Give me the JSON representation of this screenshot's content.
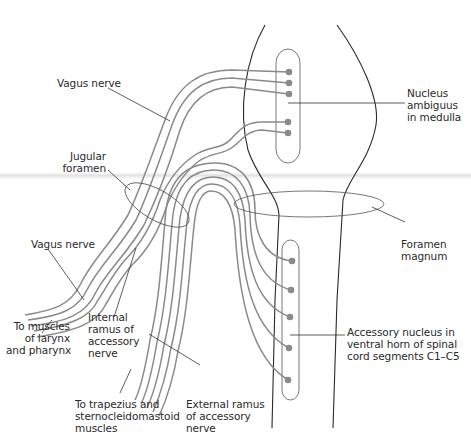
{
  "diagram": {
    "labels": {
      "vagus_nerve_upper": "Vagus nerve",
      "nucleus_ambiguus": "Nucleus\nambiguus\nin medulla",
      "jugular_foramen": "Jugular\nforamen",
      "foramen_magnum": "Foramen\nmagnum",
      "vagus_nerve_lower": "Vagus nerve",
      "to_muscles_larynx": "To muscles\nof larynx\nand pharynx",
      "internal_ramus": "Internal\nramus of\naccessory\nnerve",
      "accessory_nucleus": "Accessory nucleus in\nventral horn of spinal\ncord segments C1–C5",
      "to_trapezius": "To trapezius and\nsternocleidomastoid\nmuscles",
      "external_ramus": "External ramus\nof accessory\nnerve"
    },
    "cutoff_caption": "Cranial and spinal nerve roots",
    "colors": {
      "nerve": "#8a8a8a",
      "outline": "#2a2a2a",
      "text": "#2a2a2a",
      "background": "#ffffff"
    }
  }
}
